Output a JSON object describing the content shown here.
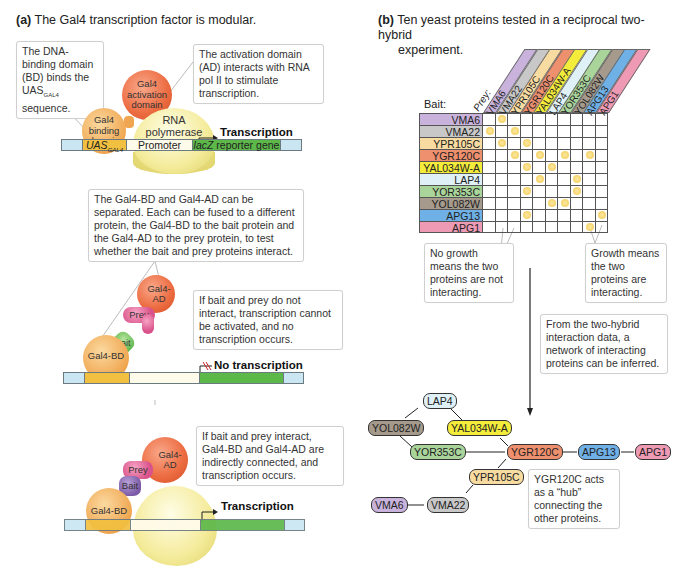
{
  "panel_a": {
    "label": "(a)",
    "title": "The Gal4 transcription factor is modular.",
    "callout_bd": "The DNA-binding domain (BD) binds the UAS",
    "callout_bd_sub": "GAL4",
    "callout_bd_tail": "sequence.",
    "callout_ad": "The activation domain (AD) interacts with RNA pol II to stimulate transcription.",
    "diagram1": {
      "activation_domain": "Gal4 activation domain",
      "binding_domain": "Gal4 binding domain",
      "polymerase": "RNA polymerase",
      "transcription": "Transcription",
      "dna_segments": {
        "uas": "UAS",
        "uas_sub": "GAL4",
        "promoter": "Promoter",
        "reporter_italic": "lacZ",
        "reporter_rest": " reporter gene"
      }
    },
    "callout_separated": "The Gal4-BD and Gal4-AD can be separated. Each can be fused to a different protein, the Gal4-BD to the bait protein and the Gal4-AD to the prey protein, to test whether the bait and prey proteins interact.",
    "diagram2": {
      "ad": "Gal4-AD",
      "prey": "Prey",
      "bait": "Bait",
      "bd": "Gal4-BD",
      "status": "No transcription",
      "callout": "If bait and prey do not interact, transcription cannot be activated, and no transcription occurs."
    },
    "diagram3": {
      "ad": "Gal4-AD",
      "prey": "Prey",
      "bait": "Bait",
      "bd": "Gal4-BD",
      "status": "Transcription",
      "callout": "If bait and prey interact, Gal4-BD and Gal4-AD are indirectly connected, and transcription occurs."
    }
  },
  "panel_b": {
    "label": "(b)",
    "title_line1": "Ten yeast proteins tested in a reciprocal two-hybrid",
    "title_line2": "experiment.",
    "bait_header": "Bait:",
    "prey_header": "Prey:",
    "proteins": [
      {
        "name": "VMA6",
        "color": "#c9b3dc"
      },
      {
        "name": "VMA22",
        "color": "#c8c8c8"
      },
      {
        "name": "YPR105C",
        "color": "#f7dba0"
      },
      {
        "name": "YGR120C",
        "color": "#ee8f6e"
      },
      {
        "name": "YAL034W-A",
        "color": "#f4ec3a"
      },
      {
        "name": "LAP4",
        "color": "#dff1f7"
      },
      {
        "name": "YOR353C",
        "color": "#a9d49a"
      },
      {
        "name": "YOL082W",
        "color": "#a59a8c"
      },
      {
        "name": "APG13",
        "color": "#6fb0e6"
      },
      {
        "name": "APG1",
        "color": "#ee9ab4"
      }
    ],
    "interactions_grid": [
      [
        0,
        1,
        0,
        0,
        0,
        0,
        0,
        0,
        0,
        0
      ],
      [
        1,
        0,
        1,
        0,
        0,
        0,
        0,
        0,
        0,
        0
      ],
      [
        0,
        1,
        0,
        1,
        0,
        0,
        0,
        0,
        0,
        0
      ],
      [
        0,
        0,
        1,
        0,
        1,
        0,
        1,
        0,
        1,
        0
      ],
      [
        0,
        0,
        0,
        1,
        0,
        1,
        0,
        0,
        0,
        0
      ],
      [
        0,
        0,
        0,
        0,
        1,
        0,
        0,
        1,
        0,
        0
      ],
      [
        0,
        0,
        0,
        1,
        0,
        0,
        0,
        1,
        0,
        0
      ],
      [
        0,
        0,
        0,
        0,
        0,
        1,
        1,
        0,
        0,
        0
      ],
      [
        0,
        0,
        0,
        1,
        0,
        0,
        0,
        0,
        0,
        1
      ],
      [
        0,
        0,
        0,
        0,
        0,
        0,
        0,
        0,
        1,
        0
      ]
    ],
    "callout_no_growth": "No growth means the two proteins are not interacting.",
    "callout_growth": "Growth means the two proteins are interacting.",
    "callout_network": "From the two-hybrid interaction data, a network of interacting proteins can be inferred.",
    "callout_hub": "YGR120C acts as a “hub” connecting the other proteins.",
    "network_nodes": {
      "lap4": "LAP4",
      "yol082w": "YOL082W",
      "yal034wa": "YAL034W-A",
      "yor353c": "YOR353C",
      "ygr120c": "YGR120C",
      "apg13": "APG13",
      "apg1": "APG1",
      "ypr105c": "YPR105C",
      "vma6": "VMA6",
      "vma22": "VMA22"
    }
  }
}
